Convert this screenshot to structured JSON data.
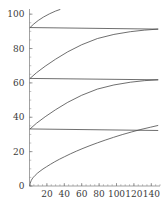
{
  "chart_data": {
    "type": "line",
    "title": "",
    "subtitle": "",
    "xlabel": "",
    "ylabel": "",
    "xlim": [
      0,
      150
    ],
    "ylim": [
      0,
      103
    ],
    "grid": false,
    "legend": "none",
    "xticks": [
      20,
      40,
      60,
      80,
      100,
      120,
      140
    ],
    "xtick_labels": [
      "20",
      "40",
      "60",
      "80",
      "100",
      "120",
      "140"
    ],
    "yticks": [
      0,
      20,
      40,
      60,
      80,
      100
    ],
    "ytick_labels": [
      "0",
      "20",
      "40",
      "60",
      "80",
      "100"
    ],
    "x_minor_step": 5,
    "y_minor_step": 5,
    "wrap_offset": 29.5,
    "series": [
      {
        "name": "branch-1",
        "comment": "lowest concave branch from origin to right edge",
        "points": [
          [
            0.4,
            0.0
          ],
          [
            0.8,
            1.4
          ],
          [
            1.3,
            2.3
          ],
          [
            2.0,
            3.2
          ],
          [
            3.0,
            4.1
          ],
          [
            4.5,
            5.1
          ],
          [
            6.5,
            6.2
          ],
          [
            9.0,
            7.4
          ],
          [
            12.0,
            8.6
          ],
          [
            15.5,
            9.9
          ],
          [
            19.5,
            11.2
          ],
          [
            24.0,
            12.6
          ],
          [
            29.0,
            14.1
          ],
          [
            34.5,
            15.6
          ],
          [
            40.5,
            17.1
          ],
          [
            47.0,
            18.7
          ],
          [
            54.0,
            20.3
          ],
          [
            61.5,
            21.9
          ],
          [
            69.5,
            23.5
          ],
          [
            78.0,
            25.1
          ],
          [
            87.0,
            26.7
          ],
          [
            96.5,
            28.3
          ],
          [
            106.5,
            29.9
          ],
          [
            117.0,
            31.4
          ],
          [
            128.0,
            32.9
          ],
          [
            139.0,
            34.2
          ],
          [
            147.5,
            35.2
          ]
        ]
      },
      {
        "name": "return-1",
        "comment": "near-horizontal return segment at about 33",
        "points": [
          [
            0.6,
            33.2
          ],
          [
            147.5,
            32.3
          ]
        ]
      },
      {
        "name": "branch-2",
        "comment": "second ramp, left edge to right edge",
        "points": [
          [
            0.6,
            33.2
          ],
          [
            8.0,
            36.5
          ],
          [
            18.0,
            40.3
          ],
          [
            30.0,
            44.4
          ],
          [
            44.0,
            48.7
          ],
          [
            60.0,
            52.8
          ],
          [
            78.0,
            56.4
          ],
          [
            97.0,
            58.8
          ],
          [
            116.0,
            60.4
          ],
          [
            132.0,
            61.3
          ],
          [
            147.5,
            61.8
          ]
        ]
      },
      {
        "name": "return-2",
        "comment": "near-horizontal return segment at about 62",
        "points": [
          [
            0.6,
            62.6
          ],
          [
            147.5,
            61.8
          ]
        ]
      },
      {
        "name": "branch-3",
        "comment": "third ramp, left edge to right edge",
        "points": [
          [
            0.6,
            62.6
          ],
          [
            8.0,
            65.9
          ],
          [
            18.0,
            69.7
          ],
          [
            30.0,
            73.8
          ],
          [
            44.0,
            78.1
          ],
          [
            60.0,
            82.2
          ],
          [
            78.0,
            85.8
          ],
          [
            97.0,
            88.2
          ],
          [
            116.0,
            89.8
          ],
          [
            132.0,
            90.7
          ],
          [
            147.5,
            91.3
          ]
        ]
      },
      {
        "name": "return-3",
        "comment": "near-horizontal return segment at about 92",
        "points": [
          [
            0.6,
            92.2
          ],
          [
            147.5,
            91.3
          ]
        ]
      },
      {
        "name": "branch-4",
        "comment": "topmost partial ramp, clipped at the top of the frame",
        "points": [
          [
            0.6,
            92.2
          ],
          [
            5.0,
            94.3
          ],
          [
            10.0,
            96.3
          ],
          [
            16.0,
            98.3
          ],
          [
            23.0,
            100.2
          ],
          [
            30.0,
            101.8
          ],
          [
            35.0,
            102.7
          ]
        ]
      }
    ]
  }
}
